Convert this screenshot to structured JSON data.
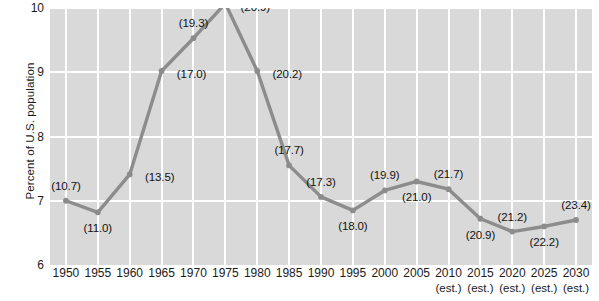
{
  "chart_data": {
    "type": "line",
    "title": "",
    "xlabel": "",
    "ylabel": "Percent of U.S. population",
    "ylim": [
      6,
      10
    ],
    "yticks": [
      6,
      7,
      8,
      9,
      10
    ],
    "ytick_labels": [
      "6",
      "7",
      "8",
      "9",
      "10"
    ],
    "grid": true,
    "legend": "none",
    "categories": [
      "1950",
      "1955",
      "1960",
      "1965",
      "1970",
      "1975",
      "1980",
      "1985",
      "1990",
      "1995",
      "2000",
      "2005",
      "2010",
      "2015",
      "2020",
      "2025",
      "2030"
    ],
    "xtick_sublabels": [
      "",
      "",
      "",
      "",
      "",
      "",
      "",
      "",
      "",
      "",
      "",
      "",
      "(est.)",
      "(est.)",
      "(est.)",
      "(est.)",
      "(est.)"
    ],
    "values": [
      7.0,
      6.82,
      7.41,
      9.02,
      9.53,
      10.07,
      9.02,
      7.55,
      7.06,
      6.85,
      7.16,
      7.3,
      7.18,
      6.72,
      6.52,
      6.6,
      6.7
    ],
    "point_labels": [
      "(10.7)",
      "(11.0)",
      "(13.5)",
      "(17.0)",
      "(19.3)",
      "(20.9)",
      "(20.2)",
      "(17.7)",
      "(17.3)",
      "(18.0)",
      "(19.9)",
      "(21.0)",
      "(21.7)",
      "(20.9)",
      "(21.2)",
      "(22.2)",
      "(23.4)"
    ],
    "point_label_side": [
      "above",
      "below",
      "right",
      "right",
      "above",
      "right",
      "right",
      "above",
      "above",
      "below",
      "above",
      "below",
      "above",
      "below",
      "above",
      "below",
      "above"
    ],
    "colors": {
      "line": "#8c8c8c",
      "marker": "#8c8c8c",
      "plot_background": "#d9d9d9",
      "gridline": "#ffffff",
      "text": "#1a1a1a",
      "page_background": "#ffffff"
    }
  }
}
